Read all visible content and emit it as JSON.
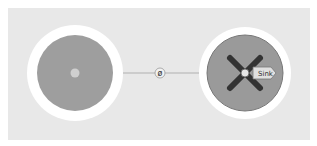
{
  "diagram": {
    "nodes": [
      {
        "id": "source",
        "label": "",
        "fill": "#9e9e9e",
        "ring": "#ffffff",
        "marker": "dot"
      },
      {
        "id": "sink",
        "label": "Sink",
        "fill": "#9e9e9e",
        "ring": "#ffffff",
        "marker": "x"
      }
    ],
    "edge": {
      "from": "source",
      "to": "sink",
      "midpoint_glyph": "ø",
      "color": "#aaaaaa"
    },
    "background": "#e8e8e8"
  }
}
